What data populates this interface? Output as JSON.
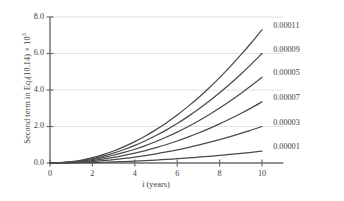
{
  "chart_data": {
    "type": "line",
    "title": "",
    "xlabel": "i (years)",
    "ylabel": "Second term in Eq.(10.14) × 10",
    "ylabel_exponent": "3",
    "xlim": [
      0,
      11
    ],
    "ylim": [
      0,
      8
    ],
    "xticks": [
      0,
      2,
      4,
      6,
      8,
      10
    ],
    "xtick_labels": [
      "0",
      "2",
      "4",
      "6",
      "8",
      "10"
    ],
    "yticks": [
      0.0,
      2.0,
      4.0,
      6.0,
      8.0
    ],
    "ytick_labels": [
      "0.0",
      "2.0",
      "4.0",
      "6.0",
      "8.0"
    ],
    "grid": "horizontal",
    "grid_color": "#e2e2e2",
    "line_color": "#4a4a4a",
    "axis_color": "#6b6b6b",
    "legend_position": "right-of-curve-ends",
    "x": [
      0,
      0.5,
      1,
      1.5,
      2,
      2.5,
      3,
      3.5,
      4,
      4.5,
      5,
      5.5,
      6,
      6.5,
      7,
      7.5,
      8,
      8.5,
      9,
      9.5,
      10
    ],
    "series": [
      {
        "name": "0.00011",
        "label": "0.00011",
        "values": [
          0,
          0.02,
          0.07,
          0.16,
          0.29,
          0.46,
          0.66,
          0.9,
          1.17,
          1.48,
          1.83,
          2.21,
          2.63,
          3.09,
          3.58,
          4.11,
          4.68,
          5.28,
          5.92,
          6.59,
          7.3
        ]
      },
      {
        "name": "0.00009",
        "label": "0.00009",
        "values": [
          0,
          0.016,
          0.058,
          0.132,
          0.238,
          0.378,
          0.542,
          0.74,
          0.962,
          1.217,
          1.504,
          1.817,
          2.162,
          2.54,
          2.943,
          3.379,
          3.847,
          4.34,
          4.866,
          5.417,
          6.0
        ]
      },
      {
        "name": "0.00007",
        "label": "0.00007",
        "values": [
          0,
          0.009,
          0.032,
          0.074,
          0.133,
          0.211,
          0.303,
          0.413,
          0.537,
          0.679,
          0.839,
          1.014,
          1.207,
          1.417,
          1.642,
          1.885,
          2.147,
          2.422,
          2.715,
          3.023,
          3.35
        ]
      },
      {
        "name": "0.00005",
        "label": "0.00005",
        "values": [
          0,
          0.013,
          0.046,
          0.104,
          0.187,
          0.296,
          0.425,
          0.58,
          0.753,
          0.953,
          1.178,
          1.424,
          1.694,
          1.99,
          2.305,
          2.646,
          3.012,
          3.399,
          3.81,
          4.243,
          4.7
        ]
      },
      {
        "name": "0.00003",
        "label": "0.00003",
        "values": [
          0,
          0.005,
          0.02,
          0.044,
          0.079,
          0.126,
          0.181,
          0.247,
          0.321,
          0.406,
          0.502,
          0.606,
          0.721,
          0.847,
          0.982,
          1.127,
          1.283,
          1.447,
          1.622,
          1.807,
          2.0
        ]
      },
      {
        "name": "0.00001",
        "label": "0.00001",
        "values": [
          0,
          0.002,
          0.006,
          0.014,
          0.026,
          0.041,
          0.059,
          0.08,
          0.104,
          0.132,
          0.163,
          0.197,
          0.234,
          0.275,
          0.319,
          0.366,
          0.417,
          0.47,
          0.527,
          0.587,
          0.65
        ]
      }
    ],
    "series_label_order": [
      "0.00011",
      "0.00009",
      "0.00007",
      "0.00005",
      "0.00003",
      "0.00001"
    ]
  }
}
